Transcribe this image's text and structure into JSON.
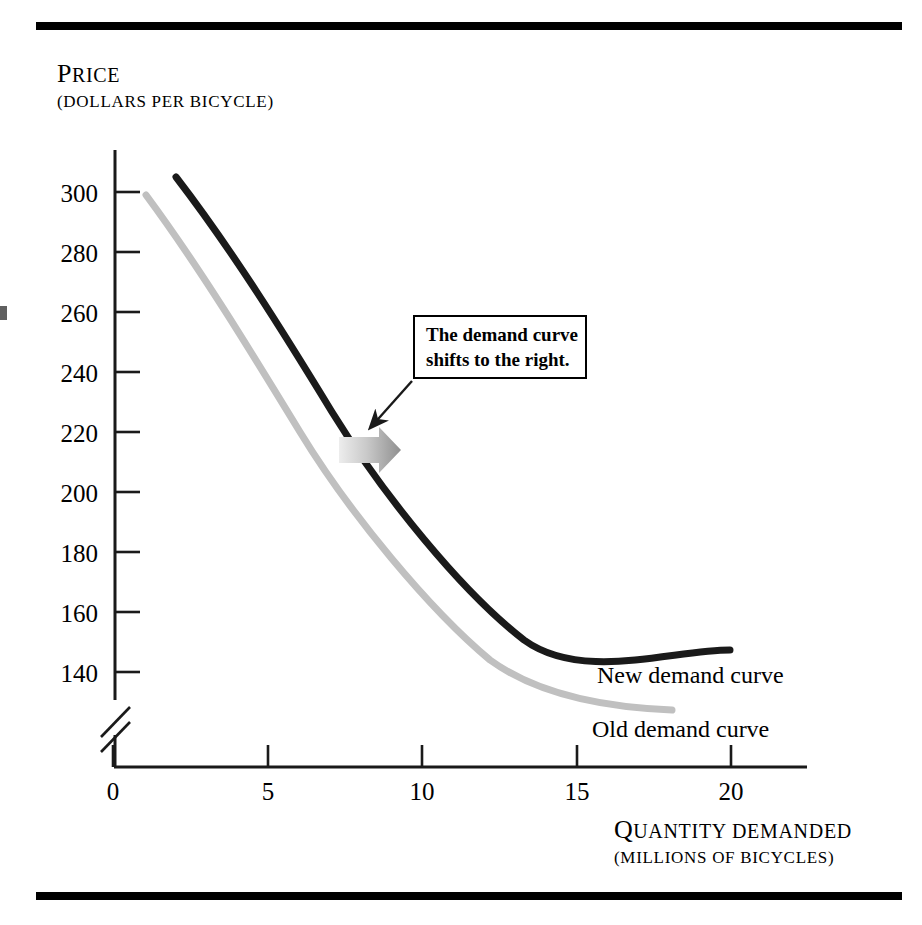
{
  "figure": {
    "background_color": "#ffffff",
    "rule_color": "#000000"
  },
  "axes": {
    "y_title_line1": "Price",
    "y_title_line2": "(Dollars per bicycle)",
    "x_title_line1": "Quantity demanded",
    "x_title_line2": "(Millions of bicycles)"
  },
  "annotations": {
    "callout_line1": "The demand curve",
    "callout_line2": "shifts to the right.",
    "shift_arrow_name": "rightward-shift-arrow"
  },
  "labels": {
    "new_curve": "New demand curve",
    "old_curve": "Old demand curve"
  },
  "colors": {
    "new_curve": "#1a1a1a",
    "old_curve": "#c0c0c0",
    "axis": "#1a1a1a",
    "shift_arrow_light": "#e2e2e2",
    "shift_arrow_dark": "#8c8c8c"
  },
  "chart_data": {
    "type": "line",
    "title": "",
    "subtitle": "",
    "xlabel": "Quantity demanded (Millions of bicycles)",
    "ylabel": "Price (Dollars per bicycle)",
    "xlim": [
      0,
      22.4
    ],
    "ylim": [
      132,
      312
    ],
    "y_axis_break": true,
    "y_axis_break_note": "axis broken between 0 and 140",
    "grid": false,
    "legend": "inline curve labels at right end of each curve",
    "x_ticks": [
      0,
      5,
      10,
      15,
      20
    ],
    "x_tick_labels": [
      "0",
      "5",
      "10",
      "15",
      "20"
    ],
    "y_ticks": [
      140,
      160,
      180,
      200,
      220,
      240,
      260,
      280,
      300
    ],
    "y_tick_labels": [
      "140",
      "160",
      "180",
      "200",
      "220",
      "240",
      "260",
      "280",
      "300"
    ],
    "series": [
      {
        "name": "Old demand curve",
        "color": "#c0c0c0",
        "x": [
          1.0,
          2.0,
          3.0,
          4.0,
          5.0,
          6.5,
          8.0,
          10.0,
          12.0,
          14.0,
          16.0,
          18.0
        ],
        "y": [
          300,
          285,
          271,
          258,
          246,
          231,
          218,
          201,
          186,
          172,
          160,
          140
        ]
      },
      {
        "name": "New demand curve",
        "color": "#1a1a1a",
        "x": [
          2.0,
          3.0,
          4.0,
          5.0,
          6.5,
          8.0,
          10.0,
          12.0,
          14.0,
          16.0,
          18.0,
          20.0
        ],
        "y": [
          305,
          290,
          277,
          265,
          250,
          237,
          222,
          207,
          193,
          180,
          168,
          156
        ]
      }
    ],
    "annotations": [
      {
        "type": "textbox",
        "text": "The demand curve shifts to the right.",
        "x": 9.6,
        "y": 238
      },
      {
        "type": "block-arrow",
        "direction": "right",
        "from_x": 7.3,
        "to_x": 9.3,
        "y": 221
      }
    ]
  },
  "y_tick_positions": [
    {
      "label": "300",
      "top": 180
    },
    {
      "label": "280",
      "top": 240
    },
    {
      "label": "260",
      "top": 300
    },
    {
      "label": "240",
      "top": 360
    },
    {
      "label": "220",
      "top": 420
    },
    {
      "label": "200",
      "top": 480
    },
    {
      "label": "180",
      "top": 540
    },
    {
      "label": "160",
      "top": 600
    },
    {
      "label": "140",
      "top": 660
    }
  ],
  "x_tick_positions": [
    {
      "label": "0",
      "left": 113
    },
    {
      "label": "5",
      "left": 268
    },
    {
      "label": "10",
      "left": 422
    },
    {
      "label": "15",
      "left": 577
    },
    {
      "label": "20",
      "left": 731
    }
  ]
}
